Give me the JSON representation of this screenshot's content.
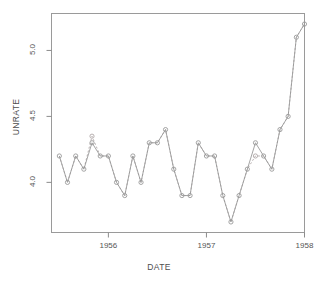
{
  "chart_data": {
    "type": "line",
    "title": "",
    "subtitle": "",
    "xlabel": "DATE",
    "ylabel": "UNRATE",
    "xlim": [
      1955.42,
      1958.0
    ],
    "ylim": [
      3.62,
      5.28
    ],
    "xticks": [
      1956,
      1957,
      1958
    ],
    "xtick_labels": [
      "1956",
      "1957",
      "1958"
    ],
    "yticks": [
      4.0,
      4.5,
      5.0
    ],
    "ytick_labels": [
      "4.0",
      "4.5",
      "5.0"
    ],
    "grid": false,
    "legend": false,
    "legend_position": "none",
    "marker": "open-circle",
    "line_color": "#9a9a9a",
    "marker_color": "#9a9a9a",
    "axis_color": "#8c8c8c",
    "background": "#ffffff",
    "x": [
      1955.5,
      1955.583,
      1955.667,
      1955.75,
      1955.833,
      1955.917,
      1956.0,
      1956.083,
      1956.167,
      1956.25,
      1956.333,
      1956.417,
      1956.5,
      1956.583,
      1956.667,
      1956.75,
      1956.833,
      1956.917,
      1957.0,
      1957.083,
      1957.167,
      1957.25,
      1957.333,
      1957.417,
      1957.5,
      1957.583,
      1957.667,
      1957.75,
      1957.833,
      1957.917
    ],
    "x_labels": [
      "1955-07",
      "1955-08",
      "1955-09",
      "1955-10",
      "1955-11",
      "1955-12",
      "1956-01",
      "1956-02",
      "1956-03",
      "1956-04",
      "1956-05",
      "1956-06",
      "1956-07",
      "1956-08",
      "1956-09",
      "1956-10",
      "1956-11",
      "1956-12",
      "1957-01",
      "1957-02",
      "1957-03",
      "1957-04",
      "1957-05",
      "1957-06",
      "1957-07",
      "1957-08",
      "1957-09",
      "1957-10",
      "1957-11",
      "1957-12"
    ],
    "series": [
      {
        "name": "UNRATE (actual)",
        "style": "solid",
        "color": "#9a9a9a",
        "values": [
          4.2,
          4.0,
          4.2,
          4.1,
          4.3,
          4.2,
          4.2,
          4.0,
          3.9,
          4.2,
          4.0,
          4.3,
          4.3,
          4.4,
          4.1,
          3.9,
          3.9,
          4.3,
          4.2,
          4.2,
          3.9,
          3.7,
          3.9,
          4.1,
          4.3,
          4.2,
          4.1,
          4.4,
          4.5,
          5.1
        ]
      },
      {
        "name": "UNRATE (alternate)",
        "style": "dotted",
        "color": "#b0a8a8",
        "values": [
          4.2,
          4.0,
          4.2,
          4.1,
          4.35,
          4.2,
          4.2,
          4.0,
          3.9,
          4.2,
          4.0,
          4.3,
          4.3,
          4.4,
          4.1,
          3.9,
          3.9,
          4.3,
          4.2,
          4.2,
          3.9,
          3.7,
          3.9,
          4.1,
          4.2,
          4.2,
          4.1,
          4.4,
          4.5,
          5.1
        ]
      }
    ],
    "last_point": {
      "x": 1958.0,
      "y": 5.2,
      "label": "1958-01"
    }
  },
  "figure": {
    "axis_titles": {
      "x": "DATE",
      "y": "UNRATE"
    }
  }
}
